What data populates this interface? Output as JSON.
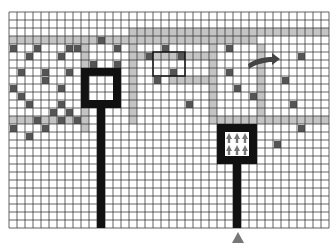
{
  "diagram": {
    "title": "",
    "grid": {
      "origin_x": 9,
      "origin_y": 12,
      "cell": 8,
      "cols": 40,
      "rows": 27,
      "line_color": "#3a3a3a",
      "background": "#ffffff"
    },
    "colors": {
      "path": "#c4c4c4",
      "obstacle": "#555555",
      "frame": "#111111",
      "marker": "#777777",
      "arrow": "#444444"
    },
    "paths": [
      {
        "c0": 0,
        "r0": 3,
        "c1": 26,
        "r1": 3
      },
      {
        "c0": 15,
        "r0": 2,
        "c1": 39,
        "r1": 2
      },
      {
        "c0": 25,
        "r0": 2,
        "c1": 30,
        "r1": 3
      },
      {
        "c0": 9,
        "r0": 3,
        "c1": 9,
        "r1": 9
      },
      {
        "c0": 15,
        "r0": 3,
        "c1": 15,
        "r1": 13
      },
      {
        "c0": 25,
        "r0": 3,
        "c1": 25,
        "r1": 13
      },
      {
        "c0": 31,
        "r0": 4,
        "c1": 31,
        "r1": 13
      },
      {
        "c0": 0,
        "r0": 13,
        "c1": 9,
        "r1": 13
      },
      {
        "c0": 25,
        "r0": 13,
        "c1": 39,
        "r1": 13
      },
      {
        "c0": 9,
        "r0": 9,
        "c1": 9,
        "r1": 14
      },
      {
        "c0": 15,
        "r0": 5,
        "c1": 24,
        "r1": 5
      },
      {
        "c0": 20,
        "r0": 8,
        "c1": 25,
        "r1": 8
      }
    ],
    "obstacles": [
      [
        0,
        4
      ],
      [
        3,
        4
      ],
      [
        7,
        4
      ],
      [
        8,
        4
      ],
      [
        11,
        3
      ],
      [
        13,
        4
      ],
      [
        2,
        5
      ],
      [
        6,
        5
      ],
      [
        10,
        6
      ],
      [
        13,
        6
      ],
      [
        1,
        7
      ],
      [
        4,
        7
      ],
      [
        7,
        7
      ],
      [
        4,
        8
      ],
      [
        0,
        9
      ],
      [
        6,
        9
      ],
      [
        1,
        10
      ],
      [
        2,
        11
      ],
      [
        5,
        12
      ],
      [
        3,
        13
      ],
      [
        6,
        13
      ],
      [
        4,
        14
      ],
      [
        0,
        14
      ],
      [
        2,
        15
      ],
      [
        7,
        12
      ],
      [
        6,
        11
      ],
      [
        8,
        13
      ],
      [
        19,
        4
      ],
      [
        17,
        5
      ],
      [
        21,
        5
      ],
      [
        20,
        7
      ],
      [
        18,
        8
      ],
      [
        13,
        9
      ],
      [
        27,
        4
      ],
      [
        36,
        5
      ],
      [
        27,
        7
      ],
      [
        30,
        10
      ],
      [
        22,
        11
      ],
      [
        35,
        11
      ],
      [
        28,
        9
      ],
      [
        36,
        14
      ],
      [
        29,
        15
      ],
      [
        33,
        16
      ],
      [
        34,
        8
      ]
    ],
    "selection_box": {
      "c0": 18,
      "r0": 5,
      "c1": 21,
      "r1": 8
    },
    "left_goal": {
      "frame": {
        "c0": 9,
        "r0": 7,
        "c1": 13,
        "r1": 11
      },
      "stem": {
        "c": 11,
        "r0": 11,
        "r1": 27
      }
    },
    "right_goal": {
      "frame": {
        "c0": 26,
        "r0": 14,
        "c1": 30,
        "r1": 18
      },
      "stem": {
        "c": 28,
        "r0": 18,
        "r1": 27
      },
      "arrow_rows": 2,
      "arrow_cols": 3
    },
    "direction_arrow": {
      "x": 248,
      "y": 56
    },
    "agent_marker": {
      "x": 238,
      "y": 238,
      "label": "agent"
    }
  }
}
